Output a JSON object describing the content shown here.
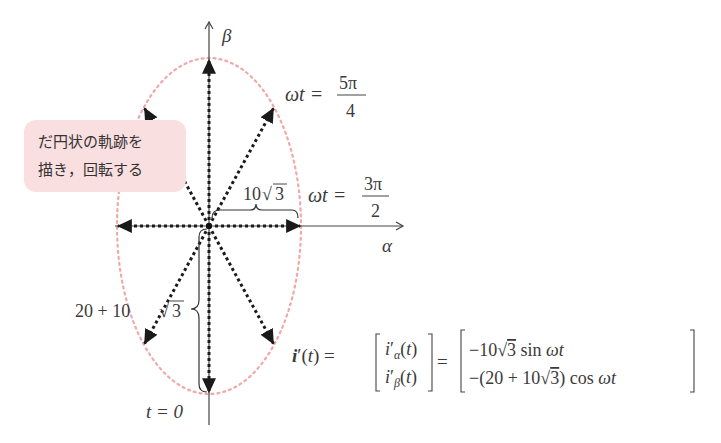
{
  "axes": {
    "alpha_label": "α",
    "beta_label": "β"
  },
  "annotation": {
    "line1": "だ円状の軌跡を",
    "line2": "描き，回転する"
  },
  "labels": {
    "angle_5pi4_lhs": "ωt =",
    "angle_5pi4_num": "5π",
    "angle_5pi4_den": "4",
    "angle_3pi2_lhs": "ωt =",
    "angle_3pi2_num": "3π",
    "angle_3pi2_den": "2",
    "t_zero": "t = 0",
    "semi_minor": "10√3",
    "semi_minor_coef": "10",
    "semi_minor_rad": "3",
    "semi_major_prefix": "20 + 10",
    "semi_major_rad": "3"
  },
  "equation": {
    "lhs": "i′(t) =",
    "vec_top": "i′α(t)",
    "vec_bottom": "i′β(t)",
    "rhs_top": "−10√3  sin ωt",
    "rhs_bottom": "−(20 + 10√3) cos ωt",
    "equals": "="
  },
  "trajectory": {
    "semi_alpha": "10√3",
    "semi_beta": "20 + 10√3",
    "ellipse_color": "#f0a8a8",
    "vector_color": "#1a1a1a",
    "vector_angles_wt": [
      "0",
      "π/4",
      "π/2",
      "3π/4",
      "π",
      "5π/4",
      "3π/2",
      "7π/4"
    ]
  }
}
